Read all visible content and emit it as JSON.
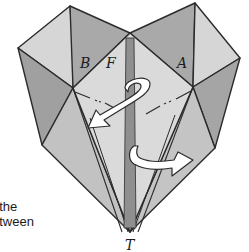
{
  "diagram": {
    "type": "origami-heart-fold-step",
    "labels": {
      "b": "B",
      "f": "F",
      "a": "A",
      "t": "T"
    },
    "caption_lines": [
      "t the",
      "etween"
    ],
    "colors": {
      "light_face": "#d8d8d8",
      "mid_face": "#bcbcbc",
      "dark_face": "#9a9a9a",
      "center_strip": "#8e8e8e",
      "outline": "#2b2b2b",
      "arrow_fill": "#ffffff",
      "background": "#ffffff"
    },
    "arrows": [
      {
        "name": "rotate-fold-arrow",
        "direction": "curl-down-left"
      },
      {
        "name": "flip-right-arrow",
        "direction": "curl-right"
      }
    ]
  }
}
